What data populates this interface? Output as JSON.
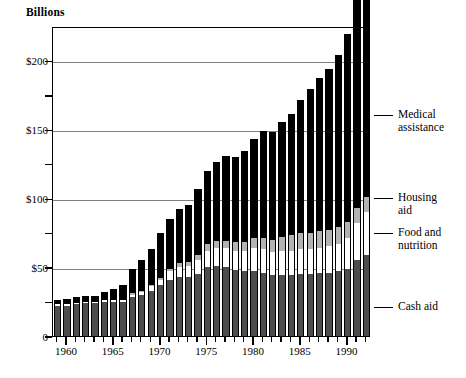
{
  "chart_data": {
    "type": "bar",
    "subtype": "stacked-vertical",
    "title": "",
    "unit_title": "Billions",
    "xlabel": "",
    "ylabel": "",
    "ylim": [
      0,
      225
    ],
    "grid": true,
    "grid_axis": "y",
    "legend_position": "right-annotations",
    "y_ticks_major": [
      0,
      50,
      100,
      150,
      200
    ],
    "y_tick_labels": [
      "0",
      "$50",
      "$100",
      "$150",
      "$200"
    ],
    "y_ticks_minor": [
      25,
      75,
      125,
      175
    ],
    "x_tick_labels": [
      "1960",
      "1965",
      "1970",
      "1975",
      "1980",
      "1985",
      "1990"
    ],
    "x_tick_years": [
      1960,
      1965,
      1970,
      1975,
      1980,
      1985,
      1990
    ],
    "categories": [
      1959,
      1960,
      1961,
      1962,
      1963,
      1964,
      1965,
      1966,
      1967,
      1968,
      1969,
      1970,
      1971,
      1972,
      1973,
      1974,
      1975,
      1976,
      1977,
      1978,
      1979,
      1980,
      1981,
      1982,
      1983,
      1984,
      1985,
      1986,
      1987,
      1988,
      1989,
      1990,
      1991,
      1992
    ],
    "series": [
      {
        "name": "Cash aid",
        "color": "#4d4d4d",
        "values": [
          22,
          22,
          23,
          24,
          24,
          25,
          25,
          25,
          28,
          30,
          33,
          37,
          41,
          43,
          43,
          45,
          50,
          51,
          50,
          48,
          47,
          47,
          46,
          44,
          44,
          44,
          45,
          45,
          46,
          46,
          47,
          49,
          55,
          59
        ]
      },
      {
        "name": "Food and nutrition",
        "color": "#ffffff",
        "values": [
          1,
          1,
          1,
          1,
          1,
          1,
          1,
          1,
          2,
          2,
          3,
          4,
          6,
          7,
          8,
          10,
          12,
          13,
          14,
          14,
          15,
          17,
          17,
          17,
          18,
          18,
          18,
          18,
          18,
          19,
          20,
          22,
          27,
          31
        ]
      },
      {
        "name": "Housing aid",
        "color": "#b3b3b3",
        "values": [
          0,
          0,
          0,
          0,
          0,
          0,
          0,
          0,
          1,
          1,
          1,
          1,
          2,
          3,
          3,
          4,
          5,
          5,
          5,
          6,
          6,
          7,
          8,
          9,
          10,
          11,
          12,
          12,
          12,
          12,
          12,
          12,
          11,
          11
        ]
      },
      {
        "name": "Medical assistance",
        "color": "#000000",
        "values": [
          3,
          4,
          4,
          4,
          4,
          6,
          8,
          11,
          18,
          22,
          26,
          33,
          36,
          39,
          41,
          48,
          53,
          57,
          62,
          62,
          66,
          72,
          78,
          78,
          83,
          88,
          96,
          104,
          111,
          117,
          125,
          136,
          161,
          185
        ]
      }
    ],
    "totals": [
      26,
      27,
      28,
      29,
      29,
      32,
      34,
      37,
      49,
      55,
      63,
      75,
      85,
      92,
      95,
      107,
      120,
      126,
      131,
      130,
      134,
      143,
      149,
      148,
      155,
      161,
      171,
      179,
      187,
      194,
      204,
      219,
      254,
      286
    ]
  },
  "annotations": [
    {
      "id": "medical-assistance",
      "text": "Medical\nassistance",
      "x": 398,
      "y": 108
    },
    {
      "id": "housing-aid",
      "text": "Housing\naid",
      "x": 398,
      "y": 191
    },
    {
      "id": "food-and-nutrition",
      "text": "Food and\nnutrition",
      "x": 398,
      "y": 226
    },
    {
      "id": "cash-aid",
      "text": "Cash aid",
      "x": 398,
      "y": 300
    }
  ]
}
